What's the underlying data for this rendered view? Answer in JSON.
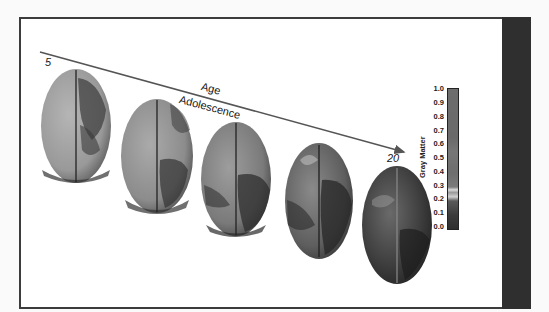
{
  "figure": {
    "arrow": {
      "start_label": "5",
      "end_label": "20",
      "title": "Age",
      "subtitle": "Adolescence"
    },
    "brains": [
      {
        "age_index": 1,
        "shade": "light"
      },
      {
        "age_index": 2,
        "shade": "light-medium"
      },
      {
        "age_index": 3,
        "shade": "medium"
      },
      {
        "age_index": 4,
        "shade": "medium-dark"
      },
      {
        "age_index": 5,
        "shade": "dark"
      }
    ],
    "colorbar": {
      "title": "Gray Matter",
      "ticks": [
        "1.0",
        "0.9",
        "0.8",
        "0.7",
        "0.6",
        "0.5",
        "0.4",
        "0.3",
        "0.2",
        "0.1",
        "0.0"
      ]
    }
  },
  "colors": {
    "frame_border": "#3c3c3c",
    "side_bar": "#2f2f2f",
    "arrow": "#555555"
  }
}
